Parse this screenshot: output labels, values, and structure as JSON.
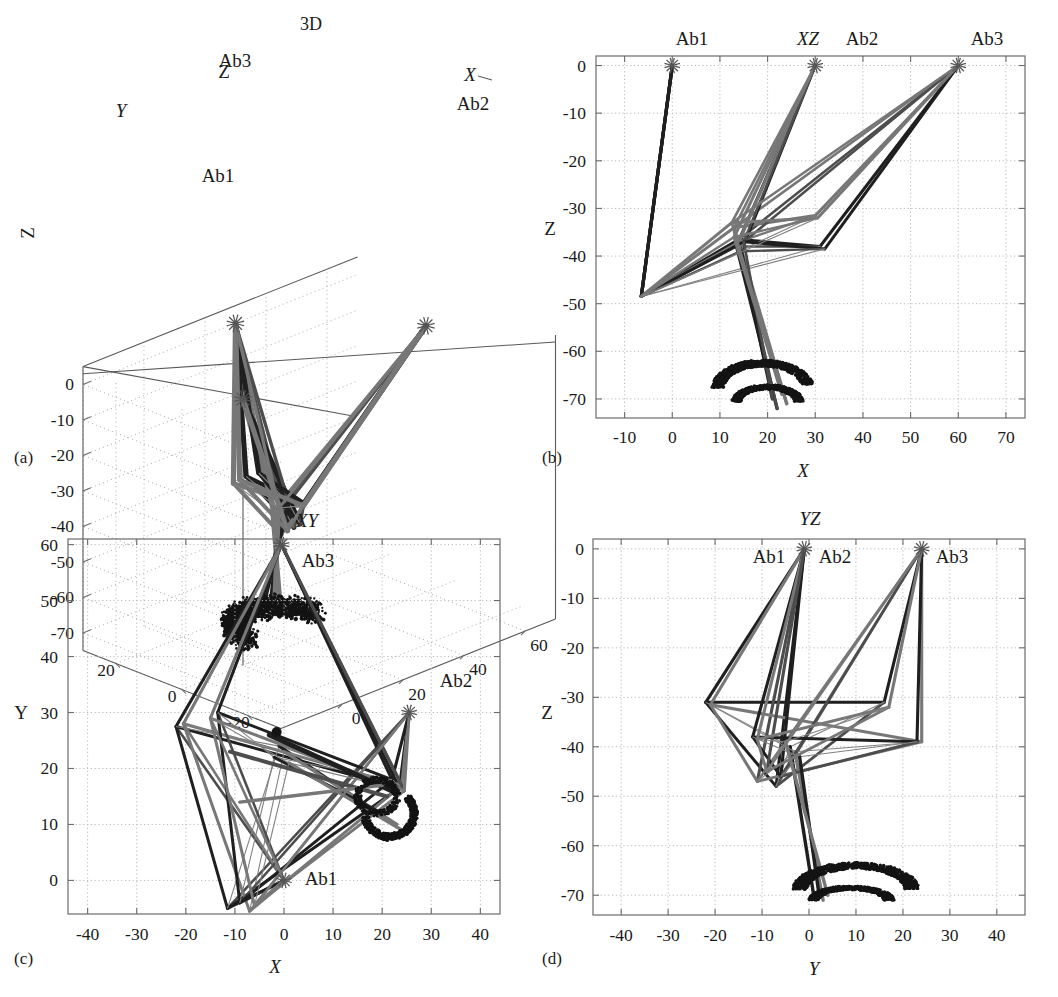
{
  "figure": {
    "background": "#ffffff",
    "ink": "#1a1a1a",
    "captions": {
      "a": "(a)",
      "b": "(b)",
      "c": "(c)",
      "d": "(d)"
    }
  },
  "colors": {
    "cable_dark": "#1f1f1f",
    "cable_mid": "#4d4d4d",
    "cable_gray": "#777777",
    "strut_thin": "#828282",
    "grid": "#b9b9b9",
    "axis": "#6b6b6b",
    "point_cloud": "#141414",
    "marker": "#555555"
  },
  "anchors": {
    "labels": [
      "Ab1",
      "Ab2",
      "Ab3"
    ],
    "marker_glyph": "asterisk",
    "positions_3d": [
      {
        "name": "Ab1",
        "x": 0,
        "y": 0,
        "z": 0
      },
      {
        "name": "Ab2",
        "x": 30,
        "y": 30,
        "z": 0
      },
      {
        "name": "Ab3",
        "x": 60,
        "y": 60,
        "z": 0
      }
    ]
  },
  "chart_data": [
    {
      "id": "panel-a",
      "type": "scatter",
      "title": "3D",
      "projection": "3D",
      "caption": "(a)",
      "xlabel": "X",
      "ylabel": "Y",
      "zlabel": "Z",
      "xlim": [
        -20,
        70
      ],
      "ylim": [
        -30,
        30
      ],
      "zlim": [
        -75,
        5
      ],
      "xticks": [
        0,
        20,
        40,
        60
      ],
      "yticks": [
        20,
        0,
        -20
      ],
      "zticks": [
        0,
        -10,
        -20,
        -30,
        -40,
        -50,
        -60,
        -70
      ],
      "xticklabels": [
        "0",
        "20",
        "40",
        "60"
      ],
      "yticklabels": [
        "20",
        "0",
        "-20"
      ],
      "zticklabels": [
        "0",
        "-10",
        "-20",
        "-30",
        "-40",
        "-50",
        "-60",
        "-70"
      ],
      "grid": true,
      "legend": "none",
      "annotations": [
        {
          "text": "3D",
          "role": "title"
        },
        {
          "text": "Z",
          "role": "axis-name"
        },
        {
          "text": "Y",
          "role": "axis-name"
        },
        {
          "text": "X",
          "role": "axis-name"
        },
        {
          "text": "Ab1",
          "role": "anchor-label"
        },
        {
          "text": "Ab2",
          "role": "anchor-label"
        },
        {
          "text": "Ab3",
          "role": "anchor-label"
        }
      ]
    },
    {
      "id": "panel-b",
      "type": "scatter",
      "title": "XZ",
      "projection": "XZ",
      "caption": "(b)",
      "xlabel": "X",
      "ylabel": "Z",
      "xlim": [
        -16,
        74
      ],
      "ylim": [
        -74,
        2
      ],
      "xticks": [
        -10,
        0,
        10,
        20,
        30,
        40,
        50,
        60,
        70
      ],
      "yticks": [
        0,
        -10,
        -20,
        -30,
        -40,
        -50,
        -60,
        -70
      ],
      "xticklabels": [
        "-10",
        "0",
        "10",
        "20",
        "30",
        "40",
        "50",
        "60",
        "70"
      ],
      "yticklabels": [
        "0",
        "-10",
        "-20",
        "-30",
        "-40",
        "-50",
        "-60",
        "-70"
      ],
      "grid": true,
      "legend": "none",
      "anchor_points": [
        {
          "name": "Ab1",
          "x": 0,
          "y": 0
        },
        {
          "name": "Ab2",
          "x": 30,
          "y": 0
        },
        {
          "name": "Ab3",
          "x": 60,
          "y": 0
        }
      ],
      "annotations": [
        {
          "text": "Ab1",
          "role": "anchor-label"
        },
        {
          "text": "XZ",
          "role": "title"
        },
        {
          "text": "Ab2",
          "role": "anchor-label"
        },
        {
          "text": "Ab3",
          "role": "anchor-label"
        }
      ]
    },
    {
      "id": "panel-c",
      "type": "scatter",
      "title": "XY",
      "projection": "XY",
      "caption": "(c)",
      "xlabel": "X",
      "ylabel": "Y",
      "xlim": [
        -44,
        44
      ],
      "ylim": [
        -6,
        61
      ],
      "xticks": [
        -40,
        -30,
        -20,
        -10,
        0,
        10,
        20,
        30,
        40
      ],
      "yticks": [
        0,
        10,
        20,
        30,
        40,
        50,
        60
      ],
      "xticklabels": [
        "-40",
        "-30",
        "-20",
        "-10",
        "0",
        "10",
        "20",
        "30",
        "40"
      ],
      "yticklabels": [
        "0",
        "10",
        "20",
        "30",
        "40",
        "50",
        "60"
      ],
      "grid": true,
      "legend": "none",
      "anchor_points": [
        {
          "name": "Ab1",
          "x": 0,
          "y": 0
        },
        {
          "name": "Ab2",
          "x": 25.5,
          "y": 30
        },
        {
          "name": "Ab3",
          "x": -0.5,
          "y": 60
        }
      ],
      "annotations": [
        {
          "text": "XY",
          "role": "title"
        },
        {
          "text": "Ab3",
          "role": "anchor-label"
        },
        {
          "text": "Ab2",
          "role": "anchor-label"
        },
        {
          "text": "Ab1",
          "role": "anchor-label"
        }
      ]
    },
    {
      "id": "panel-d",
      "type": "scatter",
      "title": "YZ",
      "projection": "YZ",
      "caption": "(d)",
      "xlabel": "Y",
      "ylabel": "Z",
      "xlim": [
        -46,
        46
      ],
      "ylim": [
        -74,
        2
      ],
      "xticks": [
        -40,
        -30,
        -20,
        -10,
        0,
        10,
        20,
        30,
        40
      ],
      "yticks": [
        0,
        -10,
        -20,
        -30,
        -40,
        -50,
        -60,
        -70
      ],
      "xticklabels": [
        "-40",
        "-30",
        "-20",
        "-10",
        "0",
        "10",
        "20",
        "30",
        "40"
      ],
      "yticklabels": [
        "0",
        "-10",
        "-20",
        "-30",
        "-40",
        "-50",
        "-60",
        "-70"
      ],
      "grid": true,
      "legend": "none",
      "anchor_points": [
        {
          "name": "Ab1",
          "x": -1,
          "y": 0
        },
        {
          "name": "Ab2",
          "x": -1,
          "y": 0
        },
        {
          "name": "Ab3",
          "x": 24,
          "y": 0
        }
      ],
      "annotations": [
        {
          "text": "YZ",
          "role": "title"
        },
        {
          "text": "Ab1",
          "role": "anchor-label"
        },
        {
          "text": "Ab2",
          "role": "anchor-label"
        },
        {
          "text": "Ab3",
          "role": "anchor-label"
        }
      ]
    }
  ],
  "mechanism": {
    "description_3d_nodes": {
      "platform_top": [
        {
          "x": 14,
          "y": 12,
          "z": -31
        },
        {
          "x": 22,
          "y": 2,
          "z": -38
        },
        {
          "x": 8,
          "y": -8,
          "z": -36
        }
      ],
      "platform_low": [
        {
          "x": 20,
          "y": 16,
          "z": -40
        },
        {
          "x": 26,
          "y": 6,
          "z": -44
        },
        {
          "x": 12,
          "y": -4,
          "z": -48
        }
      ],
      "end_effector": {
        "x": 20,
        "y": 10,
        "z": -68
      }
    },
    "cable_count": 9,
    "pose_count": 4
  }
}
